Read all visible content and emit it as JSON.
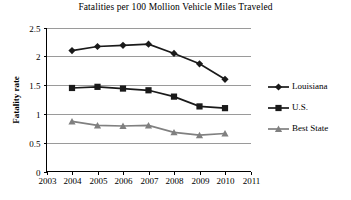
{
  "chart_data": {
    "type": "line",
    "title": "Fatalities per 100 Mollion Vehicle Miles Traveled",
    "xlabel": "",
    "ylabel": "Fatality rate",
    "x": [
      2004,
      2005,
      2006,
      2007,
      2008,
      2009,
      2010
    ],
    "xticks": [
      "2003",
      "2004",
      "2005",
      "2006",
      "2007",
      "2008",
      "2009",
      "2010",
      "2011"
    ],
    "xlim": [
      2003,
      2011
    ],
    "yticks": [
      "0",
      "0.5",
      "1",
      "1.5",
      "2",
      "2.5"
    ],
    "ylim": [
      0,
      2.5
    ],
    "grid": "horizontal",
    "legend_position": "right",
    "series": [
      {
        "name": "Louisiana",
        "marker": "diamond",
        "color": "#1a1a1a",
        "values": [
          2.1,
          2.17,
          2.19,
          2.21,
          2.05,
          1.87,
          1.6
        ]
      },
      {
        "name": "U.S.",
        "marker": "square",
        "color": "#1a1a1a",
        "values": [
          1.45,
          1.47,
          1.44,
          1.41,
          1.3,
          1.13,
          1.1
        ]
      },
      {
        "name": "Best State",
        "marker": "triangle",
        "color": "#808080",
        "values": [
          0.87,
          0.8,
          0.79,
          0.8,
          0.68,
          0.63,
          0.66
        ]
      }
    ]
  },
  "legend": {
    "items": [
      {
        "label": "Louisiana"
      },
      {
        "label": "U.S."
      },
      {
        "label": "Best State"
      }
    ]
  },
  "colors": {
    "axis": "#000000",
    "grid": "#9a9a9a",
    "dark_series": "#1a1a1a",
    "gray_series": "#808080",
    "background": "#ffffff"
  }
}
